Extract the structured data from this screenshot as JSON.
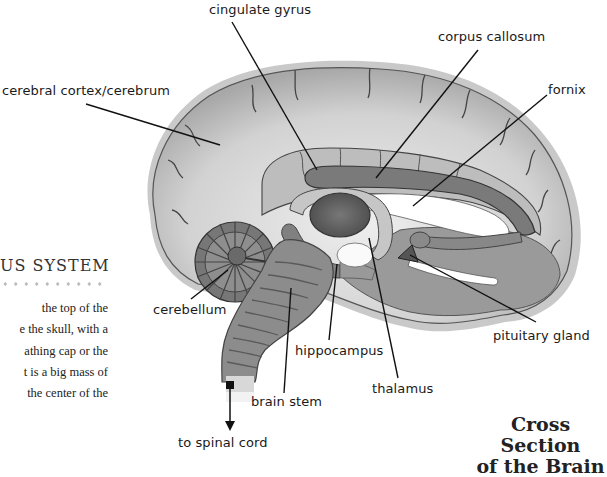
{
  "diagram": {
    "title_line1": "Cross Section",
    "title_line2": "of the Brain",
    "labels": {
      "cingulate_gyrus": "cingulate gyrus",
      "corpus_callosum": "corpus callosum",
      "cerebral_cortex": "cerebral cortex/cerebrum",
      "fornix": "fornix",
      "cerebellum": "cerebellum",
      "pituitary_gland": "pituitary gland",
      "hippocampus": "hippocampus",
      "brain_stem": "brain stem",
      "thalamus": "thalamus",
      "to_spinal_cord": "to spinal cord"
    }
  },
  "page_fragment": {
    "section_heading": "US SYSTEM",
    "body_lines": [
      "the top of the",
      "e the skull, with a",
      "athing cap or the",
      "t is a big mass of",
      "the center of the"
    ]
  }
}
